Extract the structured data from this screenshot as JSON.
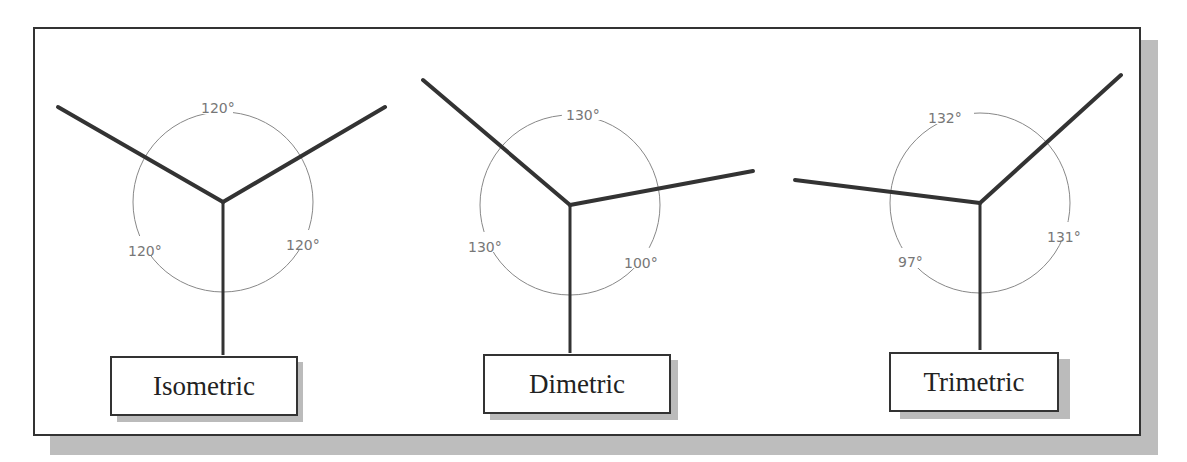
{
  "diagrams": [
    {
      "label": "Isometric",
      "angles": {
        "top": "120°",
        "left": "120°",
        "right": "120°"
      }
    },
    {
      "label": "Dimetric",
      "angles": {
        "top": "130°",
        "left": "130°",
        "right": "100°"
      }
    },
    {
      "label": "Trimetric",
      "angles": {
        "top": "132°",
        "left": "97°",
        "right": "131°"
      }
    }
  ],
  "colors": {
    "axis": "#333333",
    "arc": "#888888",
    "shadow": "#bdbdbd"
  }
}
